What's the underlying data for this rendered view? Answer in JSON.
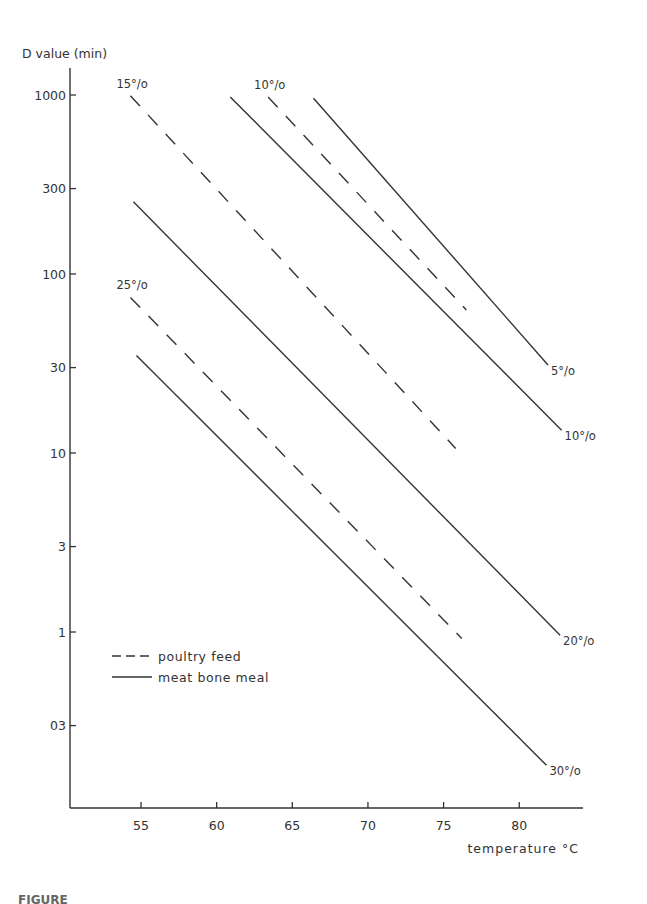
{
  "header_fragment": "",
  "caption": "FIGURE",
  "chart_data": {
    "type": "line",
    "title": "",
    "xlabel": "temperature °C",
    "ylabel": "D value (min)",
    "xscale": "linear",
    "yscale": "log",
    "xlim": [
      50.5,
      84
    ],
    "ylim": [
      0.11,
      1600
    ],
    "xticks": [
      55,
      60,
      65,
      70,
      75,
      80
    ],
    "xtick_labels": [
      "55",
      "60",
      "65",
      "70",
      "75",
      "80"
    ],
    "yticks": [
      1000,
      300,
      100,
      30,
      10,
      3,
      1,
      0.3
    ],
    "ytick_labels": [
      "1000",
      "300",
      "100",
      "30",
      "10",
      "3",
      "1",
      "03"
    ],
    "grid": false,
    "legend": {
      "position": "lower-left",
      "entries": [
        {
          "label": "poultry feed",
          "style": "dashed"
        },
        {
          "label": "meat bone meal",
          "style": "solid"
        }
      ]
    },
    "series": [
      {
        "name": "meat bone meal 5%",
        "group": "meat bone meal",
        "moisture": "5°/o",
        "style": "solid",
        "label_position": "end",
        "x": [
          66.4,
          81.9
        ],
        "y": [
          960,
          31
        ]
      },
      {
        "name": "meat bone meal 10%",
        "group": "meat bone meal",
        "moisture": "10°/o",
        "style": "solid",
        "label_position": "end",
        "x": [
          60.9,
          82.8
        ],
        "y": [
          975,
          13.4
        ]
      },
      {
        "name": "poultry feed 10%",
        "group": "poultry feed",
        "moisture": "10°/o",
        "style": "dashed",
        "label_position": "start",
        "x": [
          63.4,
          76.5
        ],
        "y": [
          975,
          63
        ]
      },
      {
        "name": "poultry feed 15%",
        "group": "poultry feed",
        "moisture": "15°/o",
        "style": "dashed",
        "label_position": "start",
        "x": [
          54.3,
          75.8
        ],
        "y": [
          990,
          10.6
        ]
      },
      {
        "name": "meat bone meal 20%",
        "group": "meat bone meal",
        "moisture": "20°/o",
        "style": "solid",
        "label_position": "end",
        "x": [
          54.5,
          82.7
        ],
        "y": [
          253,
          0.96
        ]
      },
      {
        "name": "poultry feed 25%",
        "group": "poultry feed",
        "moisture": "25°/o",
        "style": "dashed",
        "label_position": "start",
        "x": [
          54.3,
          76.2
        ],
        "y": [
          74,
          0.92
        ]
      },
      {
        "name": "meat bone meal 30%",
        "group": "meat bone meal",
        "moisture": "30°/o",
        "style": "solid",
        "label_position": "end",
        "x": [
          54.7,
          81.8
        ],
        "y": [
          35,
          0.18
        ]
      }
    ],
    "annotations": [
      "15°/o",
      "10°/o",
      "25°/o",
      "5°/o",
      "10°/o",
      "20°/o",
      "30°/o"
    ]
  },
  "colors": {
    "ink": "#333333",
    "background": "#ffffff"
  }
}
